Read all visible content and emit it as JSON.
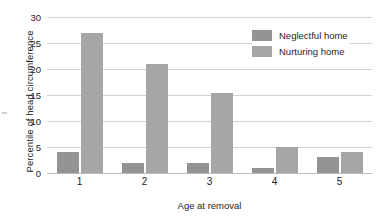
{
  "chart_data": {
    "type": "bar",
    "title": "",
    "xlabel": "Age at removal",
    "ylabel": "Percentile of head circumference",
    "categories": [
      "1",
      "2",
      "3",
      "4",
      "5"
    ],
    "series": [
      {
        "name": "Neglectful home",
        "color": "#949494",
        "values": [
          4,
          2,
          2,
          1,
          3
        ]
      },
      {
        "name": "Nurturing home",
        "color": "#a6a6a6",
        "values": [
          27,
          21,
          15.3,
          5,
          4
        ]
      }
    ],
    "ylim": [
      0,
      30
    ],
    "yticks": [
      0,
      5,
      10,
      15,
      20,
      25,
      30
    ],
    "ytick_labels": [
      "0",
      "5",
      "10",
      "15",
      "20",
      "25",
      "30"
    ],
    "grid": true,
    "legend_position": "top-right"
  },
  "legend": {
    "items": [
      {
        "label": "Neglectful home",
        "swatch": "neglectful"
      },
      {
        "label": "Nurturing home",
        "swatch": "nurturing"
      }
    ]
  }
}
